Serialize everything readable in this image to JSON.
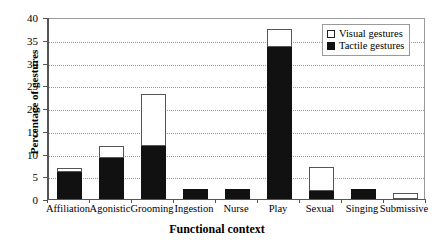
{
  "chart_data": {
    "type": "bar",
    "subtype": "stacked-vertical",
    "title": "",
    "xlabel": "Functional context",
    "ylabel": "Percentage of gestures",
    "ylim": [
      0,
      40
    ],
    "ytick_step": 5,
    "yticks": [
      "0",
      "5",
      "10",
      "15",
      "20",
      "25",
      "30",
      "35",
      "40"
    ],
    "grid": true,
    "grid_style": "dotted-horizontal",
    "legend_position": "top-right",
    "categories": [
      "Affiliation",
      "Agonistic",
      "Grooming",
      "Ingestion",
      "Nurse",
      "Play",
      "Sexual",
      "Singing",
      "Submissive"
    ],
    "series": [
      {
        "name": "Tactile gestures",
        "color": "#111111",
        "values": [
          6.0,
          9.0,
          11.7,
          2.2,
          2.3,
          33.5,
          1.8,
          2.1,
          0.0
        ]
      },
      {
        "name": "Visual gestures",
        "color": "#ffffff",
        "values": [
          0.8,
          2.7,
          11.3,
          0.0,
          0.0,
          3.8,
          5.2,
          0.0,
          1.3
        ]
      }
    ],
    "totals": [
      6.8,
      11.7,
      23.0,
      2.2,
      2.3,
      37.3,
      7.0,
      2.1,
      1.3
    ]
  },
  "legend": {
    "items": [
      {
        "label": "Visual gestures",
        "swatch": "open-square-icon"
      },
      {
        "label": "Tactile gestures",
        "swatch": "filled-square-icon"
      }
    ]
  }
}
